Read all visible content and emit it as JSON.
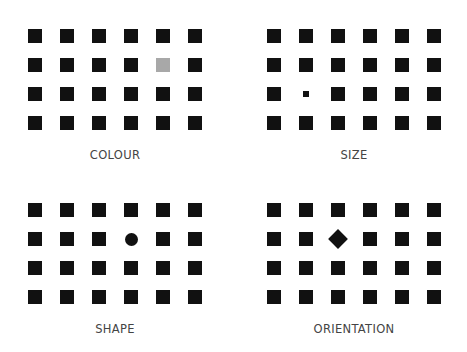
{
  "figure": {
    "panels": [
      {
        "id": "colour",
        "label": "COLOUR",
        "left": 0,
        "top": 0,
        "col_x": [
          28,
          60,
          92,
          124,
          156,
          188
        ],
        "row_y": [
          29,
          58,
          87,
          116
        ],
        "label_y": 148,
        "odd": {
          "row": 1,
          "col": 4,
          "kind": "colour",
          "color": "#a8a8a8"
        }
      },
      {
        "id": "size",
        "label": "SIZE",
        "left": 0,
        "top": 0,
        "col_x": [
          267,
          299,
          331,
          363,
          395,
          427
        ],
        "row_y": [
          29,
          58,
          87,
          116
        ],
        "label_y": 148,
        "odd": {
          "row": 2,
          "col": 1,
          "kind": "size",
          "size": 6
        }
      },
      {
        "id": "shape",
        "label": "SHAPE",
        "left": 0,
        "top": 0,
        "col_x": [
          28,
          60,
          92,
          124,
          156,
          188
        ],
        "row_y": [
          203,
          232,
          261,
          290
        ],
        "label_y": 322,
        "odd": {
          "row": 1,
          "col": 3,
          "kind": "circle"
        }
      },
      {
        "id": "orientation",
        "label": "ORIENTATION",
        "left": 0,
        "top": 0,
        "col_x": [
          267,
          299,
          331,
          363,
          395,
          427
        ],
        "row_y": [
          203,
          232,
          261,
          290
        ],
        "label_y": 322,
        "odd": {
          "row": 1,
          "col": 2,
          "kind": "diamond"
        }
      }
    ],
    "colors": {
      "square": "#111111",
      "background": "#ffffff",
      "label": "#444444"
    }
  }
}
